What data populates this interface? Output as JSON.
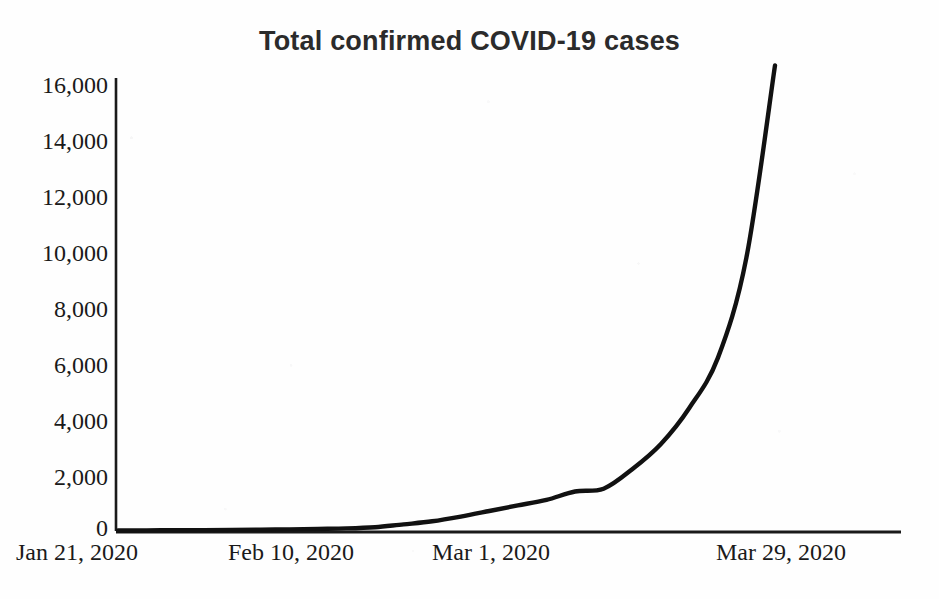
{
  "chart_data": {
    "type": "line",
    "title": "Total confirmed COVID-19 cases",
    "xlabel": "",
    "ylabel": "",
    "grid": false,
    "legend": "none",
    "ylim": [
      0,
      16000
    ],
    "ytick_labels": [
      "16,000",
      "14,000",
      "12,000",
      "10,000",
      "8,000",
      "6,000",
      "4,000",
      "2,000",
      "0"
    ],
    "ytick_values": [
      16000,
      14000,
      12000,
      10000,
      8000,
      6000,
      4000,
      2000,
      0
    ],
    "xtick_labels": [
      "Jan 21, 2020",
      "Feb 10, 2020",
      "Mar 1, 2020",
      "Mar 29, 2020"
    ],
    "x": [
      "Jan 21, 2020",
      "Jan 26, 2020",
      "Jan 31, 2020",
      "Feb 5, 2020",
      "Feb 10, 2020",
      "Feb 15, 2020",
      "Feb 20, 2020",
      "Feb 25, 2020",
      "Mar 1, 2020",
      "Mar 4, 2020",
      "Mar 7, 2020",
      "Mar 9, 2020",
      "Mar 11, 2020",
      "Mar 13, 2020",
      "Mar 15, 2020",
      "Mar 17, 2020",
      "Mar 19, 2020",
      "Mar 21, 2020",
      "Mar 23, 2020",
      "Mar 25, 2020",
      "Mar 27, 2020",
      "Mar 29, 2020",
      "Mar 31, 2020",
      "Apr 2, 2020"
    ],
    "values": [
      0,
      5,
      10,
      15,
      20,
      30,
      40,
      55,
      75,
      120,
      220,
      330,
      500,
      700,
      900,
      1100,
      1400,
      1500,
      2200,
      3100,
      4400,
      6200,
      9800,
      16700
    ],
    "series": [
      {
        "name": "Total confirmed COVID-19 cases",
        "color": "#111111",
        "line_width": 4
      }
    ],
    "annotations": [
      {
        "label": "plateau-kink",
        "x": "Mar 19, 2020",
        "value": 1400
      },
      {
        "label": "final-value",
        "x": "Apr 2, 2020",
        "value": 16700
      }
    ]
  },
  "axes": {
    "axis_color": "#1a1a1a",
    "y_axis_label_font": "serif",
    "title_font": "sans-serif"
  }
}
